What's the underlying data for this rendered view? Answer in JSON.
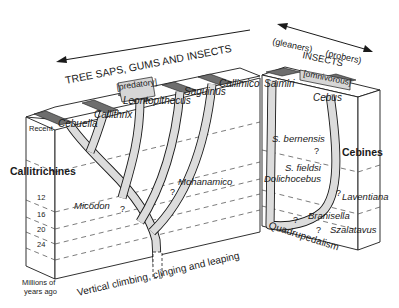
{
  "diagram": {
    "type": "phylogenetic block diagram",
    "left_block": {
      "group_label": "Callitrichines",
      "diet_label": "TREE SAPS, GUMS AND INSECTS",
      "niche_label": "[predatory]",
      "locomotion_label": "Vertical climbing, clinging and leaping",
      "taxa": {
        "cebuella": "Cebuella",
        "callithrix": "Callithrix",
        "leontopithecus": "Leontopithecus",
        "saguinus": "Saguinus",
        "callimico": "Callimico"
      },
      "fossils": {
        "micodon": "Micodon",
        "mohanamico": "Mohanamico"
      }
    },
    "right_block": {
      "group_label": "Cebines",
      "diet_label": "INSECTS",
      "arrow_left_label": "(gleaners)",
      "arrow_right_label": "(probers)",
      "niche_label": "[omnivorous]",
      "locomotion_label": "Quadrupedalism",
      "taxa": {
        "saimiri": "Saimiri",
        "cebus": "Cebus"
      },
      "fossils": {
        "s_bernensis": "S. bernensis",
        "s_fieldsi": "S. fieldsi",
        "dolichocebus": "Dolichocebus",
        "laventiana": "Laventiana",
        "branisella": "Branisella",
        "szalatavus": "Szalatavus"
      }
    },
    "time_axis": {
      "recent_label": "Recent",
      "ticks": [
        "12",
        "16",
        "20",
        "24"
      ],
      "unit_label_line1": "Millions of",
      "unit_label_line2": "years ago"
    },
    "uncertain_marker": "?"
  }
}
